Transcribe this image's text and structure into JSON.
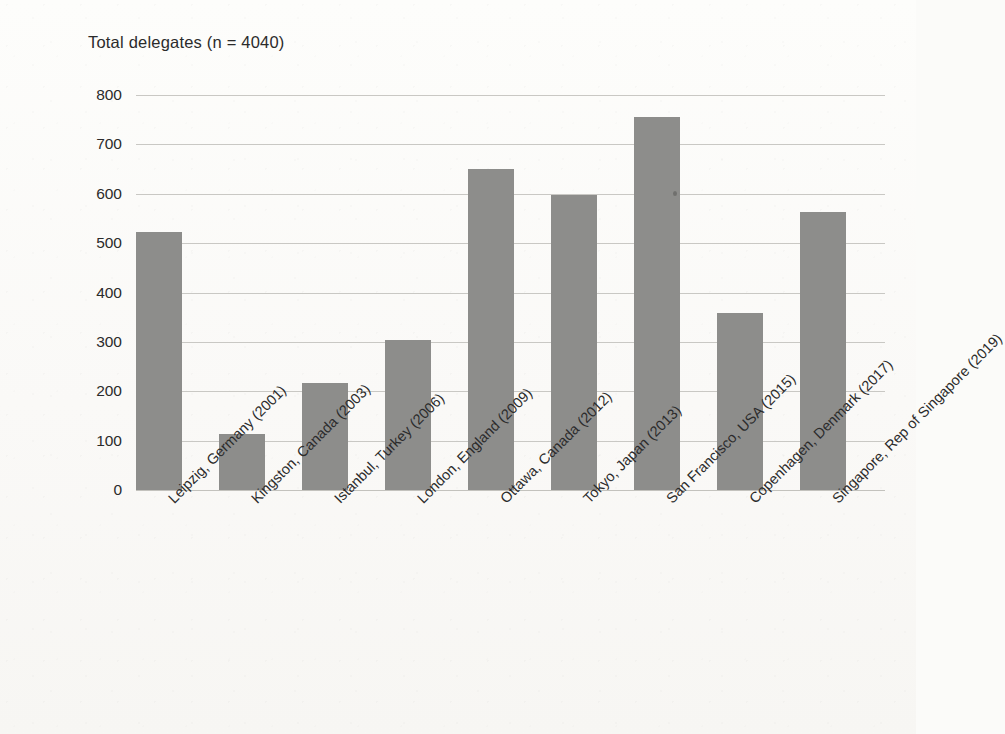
{
  "chart_data": {
    "type": "bar",
    "title": "Total delegates (n = 4040)",
    "xlabel": "",
    "ylabel": "",
    "ylim": [
      0,
      800
    ],
    "ytick_step": 100,
    "grid": true,
    "legend": false,
    "legend_position": "none",
    "bar_color": "#8d8d8b",
    "background_color": "#fbfbf9",
    "total_n": 4040,
    "categories": [
      "Leipzig, Germany (2001)",
      "Kingston, Canada (2003)",
      "Istanbul, Turkey (2006)",
      "London, England (2009)",
      "Ottawa, Canada (2012)",
      "Tokyo, Japan (2013)",
      "San Francisco, USA (2015)",
      "Copenhagen, Denmark (2017)",
      "Singapore, Rep of Singapore (2019)"
    ],
    "values": [
      522,
      113,
      217,
      303,
      650,
      597,
      755,
      358,
      563
    ],
    "ytick_labels": [
      "800",
      "700",
      "600",
      "500",
      "400",
      "300",
      "200",
      "100",
      "0"
    ],
    "yticks": [
      800,
      700,
      600,
      500,
      400,
      300,
      200,
      100,
      0
    ]
  }
}
